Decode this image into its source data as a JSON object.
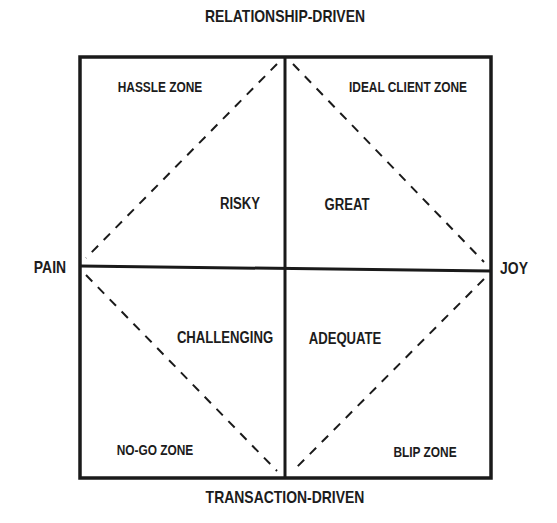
{
  "diagram": {
    "axes": {
      "top": "RELATIONSHIP-DRIVEN",
      "bottom": "TRANSACTION-DRIVEN",
      "left": "PAIN",
      "right": "JOY"
    },
    "zones": {
      "top_left": "HASSLE ZONE",
      "top_right": "IDEAL CLIENT ZONE",
      "bottom_left": "NO-GO ZONE",
      "bottom_right": "BLIP ZONE"
    },
    "inner": {
      "top_left": "RISKY",
      "top_right": "GREAT",
      "bottom_left": "CHALLENGING",
      "bottom_right": "ADEQUATE"
    },
    "colors": {
      "line": "#1a1a1a",
      "background": "#ffffff"
    }
  }
}
